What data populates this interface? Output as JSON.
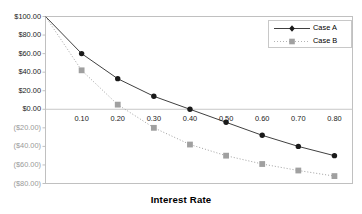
{
  "chart_data": {
    "type": "line",
    "title": "",
    "xlabel": "Interest Rate",
    "ylabel": "",
    "x": [
      0.0,
      0.1,
      0.2,
      0.3,
      0.4,
      0.5,
      0.6,
      0.7,
      0.8
    ],
    "xlim": [
      0.0,
      0.85
    ],
    "ylim": [
      -80,
      100
    ],
    "grid": false,
    "zero_line": true,
    "legend_position": "top-right",
    "xticks": [
      "0.10",
      "0.20",
      "0.30",
      "0.40",
      "0.50",
      "0.60",
      "0.70",
      "0.80"
    ],
    "xtick_values": [
      0.1,
      0.2,
      0.3,
      0.4,
      0.5,
      0.6,
      0.7,
      0.8
    ],
    "yticks": [
      "$100.00",
      "$80.00",
      "$60.00",
      "$40.00",
      "$20.00",
      "$0.00",
      "($20.00)",
      "($40.00)",
      "($60.00)",
      "($80.00)"
    ],
    "ytick_values": [
      100,
      80,
      60,
      40,
      20,
      0,
      -20,
      -40,
      -60,
      -80
    ],
    "series": [
      {
        "name": "Case A",
        "color": "#404040",
        "marker": "diamond",
        "line_style": "solid",
        "values": [
          100,
          60,
          33,
          14,
          0,
          -14,
          -28,
          -40,
          -50
        ]
      },
      {
        "name": "Case B",
        "color": "#a0a0a0",
        "marker": "square",
        "line_style": "dotted",
        "values": [
          100,
          42,
          5,
          -20,
          -38,
          -50,
          -59,
          -66,
          -72
        ]
      }
    ]
  },
  "legend": {
    "items": [
      {
        "label": "Case A"
      },
      {
        "label": "Case B"
      }
    ]
  },
  "axis": {
    "x_title": "Interest Rate"
  },
  "colors": {
    "case_a": "#404040",
    "case_b": "#a0a0a0",
    "frame": "#c0c0c0",
    "zero_line": "#c8c8c8",
    "negative_label": "#9a9a9a"
  }
}
